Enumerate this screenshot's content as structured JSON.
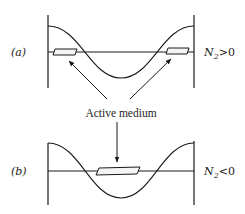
{
  "figure": {
    "panels": [
      {
        "id": "a",
        "label": "(a)",
        "label_letter": "a",
        "condition": "N₂>0",
        "condition_var": "N",
        "condition_sub": "2",
        "condition_rel": ">0",
        "medium_positions": [
          "left-edge",
          "right-edge"
        ]
      },
      {
        "id": "b",
        "label": "(b)",
        "label_letter": "b",
        "condition": "N₂<0",
        "condition_var": "N",
        "condition_sub": "2",
        "condition_rel": "<0",
        "medium_positions": [
          "center"
        ]
      }
    ],
    "annotation": "Active medium",
    "colors": {
      "stroke": "#1a1a1a",
      "background": "#ffffff"
    }
  }
}
